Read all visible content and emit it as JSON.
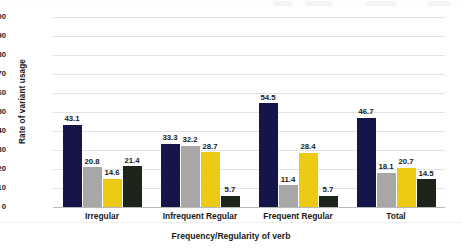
{
  "chart_data": {
    "type": "bar",
    "title": "",
    "xlabel": "Frequency/Regularity of verb",
    "ylabel": "Rate of variant usage",
    "ylim": [
      0,
      100
    ],
    "ytick_step": 10,
    "yticks": [
      "100",
      "90",
      "80",
      "70",
      "60",
      "50",
      "40",
      "30",
      "20",
      "10",
      "0"
    ],
    "grid": true,
    "legend": "none",
    "categories": [
      "Irregular",
      "Infrequent Regular",
      "Frequent Regular",
      "Total"
    ],
    "series": [
      {
        "name": "series-1",
        "color": "#16154a",
        "values": [
          43.1,
          33.3,
          54.5,
          46.7
        ]
      },
      {
        "name": "series-2",
        "color": "#a7a7a7",
        "values": [
          20.8,
          32.2,
          11.4,
          18.1
        ]
      },
      {
        "name": "series-3",
        "color": "#ecc913",
        "values": [
          14.6,
          28.7,
          28.4,
          20.7
        ]
      },
      {
        "name": "series-4",
        "color": "#1d2419",
        "values": [
          21.4,
          5.7,
          5.7,
          14.5
        ]
      }
    ],
    "data_labels": [
      [
        "43.1",
        "20.8",
        "14.6",
        "21.4"
      ],
      [
        "33.3",
        "32.2",
        "28.7",
        "5.7"
      ],
      [
        "54.5",
        "11.4",
        "28.4",
        "5.7"
      ],
      [
        "46.7",
        "18.1",
        "20.7",
        "14.5"
      ]
    ]
  }
}
